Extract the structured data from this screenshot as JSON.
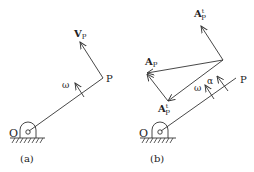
{
  "figure": {
    "panel_a": {
      "caption": "(a)",
      "pivot_label": "O",
      "point_label": "P",
      "velocity_label": "V",
      "velocity_sub": "P",
      "omega_label": "ω"
    },
    "panel_b": {
      "caption": "(b)",
      "pivot_label": "O",
      "point_label": "P",
      "accel_label": "A",
      "accel_sub": "P",
      "accel_top_label": "A",
      "accel_top_sup": "t",
      "accel_top_sub": "P",
      "accel_bottom_label": "A",
      "accel_bottom_sup": "t",
      "accel_bottom_sub": "P",
      "alpha_label": "α",
      "omega_label": "ω"
    }
  },
  "colors": {
    "line": "#333333",
    "text": "#222222",
    "background": "#ffffff"
  }
}
